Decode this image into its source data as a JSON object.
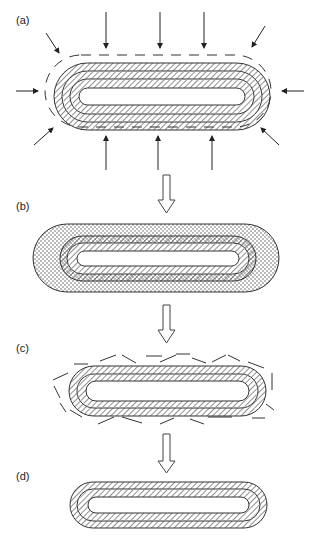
{
  "panels": [
    {
      "label": "(a)",
      "description": "Three-layer capsule with surrounding dashed boundary and inward-pointing arrows"
    },
    {
      "label": "(b)",
      "description": "Three hatched layers enclosed in a thick dotted outer coating"
    },
    {
      "label": "(c)",
      "description": "Two-layer capsule with fragmented, scattered dashed outer material"
    },
    {
      "label": "(d)",
      "description": "Clean two-layer hatched capsule"
    }
  ],
  "colors": {
    "stroke": "#333333",
    "background": "#ffffff",
    "dots": "#444444"
  }
}
